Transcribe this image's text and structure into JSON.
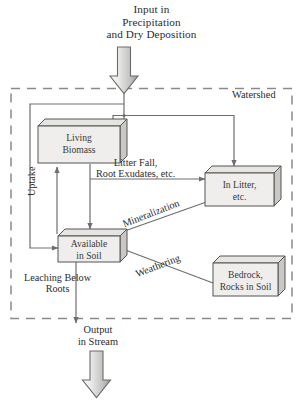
{
  "diagram": {
    "type": "flow-diagram",
    "title_lines": [
      "Input in",
      "Precipitation",
      "and Dry Deposition"
    ],
    "boundary_label": "Watershed",
    "colors": {
      "box_fill": "#efeeec",
      "box_top_fill": "#e6e5e2",
      "box_side_fill": "#c9c8c4",
      "outline": "#555555",
      "arrow_line": "#6e6e6e",
      "block_arrow_light": "#f2f2f2",
      "block_arrow_dark": "#9a9a9a",
      "dashed_border": "#8a8a8a",
      "text": "#2b2b2b"
    },
    "boxes": [
      {
        "id": "living-biomass",
        "lines": [
          "Living",
          "Biomass"
        ]
      },
      {
        "id": "in-litter",
        "lines": [
          "In Litter,",
          "etc."
        ]
      },
      {
        "id": "available-in-soil",
        "lines": [
          "Available",
          "in Soil"
        ]
      },
      {
        "id": "bedrock",
        "lines": [
          "Bedrock,",
          "Rocks in Soil"
        ]
      }
    ],
    "flow_labels": [
      {
        "id": "litter-fall",
        "lines": [
          "Litter Fall,",
          "Root Exudates, etc."
        ],
        "from": "living-biomass",
        "to": "in-litter"
      },
      {
        "id": "uptake",
        "text": "Uptake",
        "from": "available-in-soil",
        "to": "living-biomass",
        "orientation": "vertical"
      },
      {
        "id": "mineralization",
        "text": "Mineralization",
        "from": "in-litter",
        "to": "available-in-soil",
        "orientation": "diagonal"
      },
      {
        "id": "weathering",
        "text": "Weathering",
        "from": "bedrock",
        "to": "available-in-soil",
        "orientation": "diagonal"
      },
      {
        "id": "leaching",
        "lines": [
          "Leaching Below",
          "Roots"
        ],
        "from": "available-in-soil",
        "to": "output"
      }
    ],
    "output": {
      "lines": [
        "Output",
        "in Stream"
      ]
    }
  }
}
